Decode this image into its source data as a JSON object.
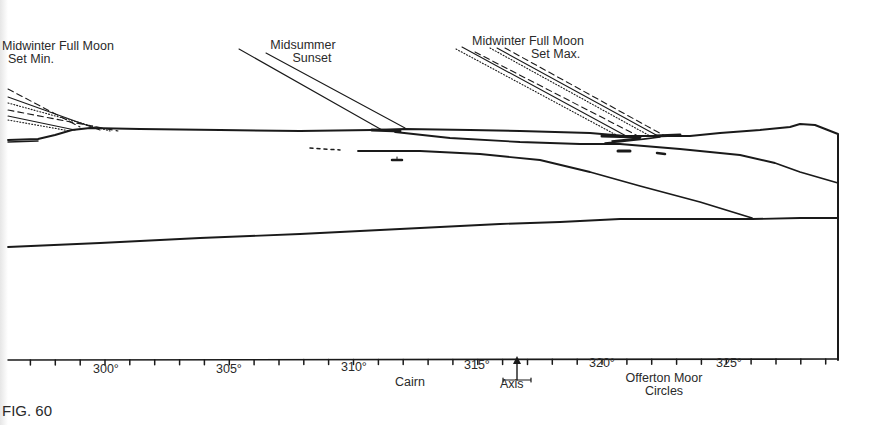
{
  "figure": {
    "caption": "FIG. 60",
    "type": "horizon-profile-diagram",
    "ink_color": "#1a1a1a"
  },
  "sightlines": [
    {
      "id": "moon-min",
      "label_line1": "Midwinter Full Moon",
      "label_line2": "Set Min.",
      "style": "moon-band"
    },
    {
      "id": "sunset",
      "label_line1": "Midsummer",
      "label_line2": "Sunset",
      "style": "solid-pair"
    },
    {
      "id": "moon-max",
      "label_line1": "Midwinter Full Moon",
      "label_line2": "Set Max.",
      "style": "moon-band"
    }
  ],
  "axis": {
    "unit": "degrees azimuth",
    "range": [
      296,
      329
    ],
    "major_ticks": [
      {
        "value": 300,
        "label": "300°"
      },
      {
        "value": 305,
        "label": "305°"
      },
      {
        "value": 310,
        "label": "310°"
      },
      {
        "value": 315,
        "label": "315°"
      },
      {
        "value": 320,
        "label": "320°"
      },
      {
        "value": 325,
        "label": "325°"
      }
    ],
    "minor_tick_step": 1
  },
  "annotations": {
    "cairn": "Cairn",
    "axis_marker": "Axis",
    "site_line1": "Offerton Moor",
    "site_line2": "Circles"
  }
}
